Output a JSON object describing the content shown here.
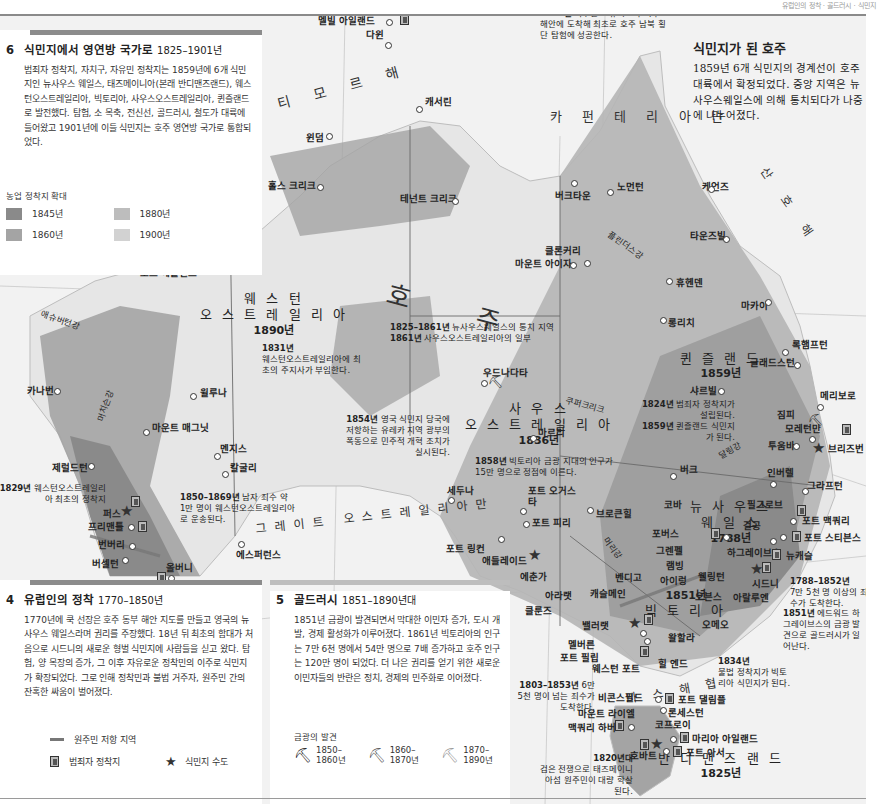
{
  "page_header": "유럽인의 정착 · 골드러시 · 식민지",
  "colors": {
    "ocean": "#f2f2f2",
    "settled_1845": "#8a8a8a",
    "settled_1860": "#a4a4a4",
    "settled_1880": "#bdbdbd",
    "settled_1900": "#d2d2d2",
    "unsettled": "#e9e9e9",
    "panel_bar": "#8c8c8c",
    "resistance": "#777777"
  },
  "panel6": {
    "number": "6",
    "title": "식민지에서 영연방 국가로",
    "years": "1825–1901년",
    "body": "범죄자 정착지, 자치구, 자유민 정착지는 1859년에 6개 식민지인 뉴사우스 웨일스, 태즈메이니아(본래 반디맨즈랜드), 웨스턴오스트레일리아, 빅토리아, 사우스오스트레일리아, 퀸즐랜드로 발전했다. 탐험, 소 목축, 전신선, 골드러시, 철도가 대륙에 들어왔고 1901년에 이들 식민지는 호주 영연방 국가로 통합되었다.",
    "legend_title": "농업 정착지 확대",
    "legend": [
      {
        "label": "1845년",
        "color": "#8a8a8a"
      },
      {
        "label": "1880년",
        "color": "#bdbdbd"
      },
      {
        "label": "1860년",
        "color": "#a4a4a4"
      },
      {
        "label": "1900년",
        "color": "#d2d2d2"
      }
    ]
  },
  "intro": {
    "title": "식민지가 된 호주",
    "body": "1859년 6개 식민지의 경계선이 호주 대륙에서 확정되었다. 중앙 지역은 뉴사우스웨일스에 의해 통치되다가 나중에 나누어졌다."
  },
  "panel4": {
    "number": "4",
    "title": "유럽인의 정착",
    "years": "1770–1850년",
    "body": "1770년에 쿡 선장은 호주 동부 해안 지도를 만들고 영국의 뉴사우스 웨일스라며 권리를 주장했다. 18년 뒤 최초의 함대가 처음으로 시드니의 새로운 형벌 식민지에 사람들을 싣고 왔다. 탐험, 양 목장의 증가, 그 이후 자유로운 정착민의 이주로 식민지가 확장되었다. 그로 인해 정착민과 불법 거주자, 원주민 간의 잔혹한 싸움이 벌어졌다.",
    "legend": {
      "resistance": "원주민 저항 지역",
      "convict": "범죄자 정착지",
      "capital": "식민지 수도"
    }
  },
  "panel5": {
    "number": "5",
    "title": "골드러시",
    "years": "1851–1890년대",
    "body": "1851년 금광이 발견되면서 막대한 이민자 증가, 도시 개발, 경제 활성화가 이루어졌다. 1861년 빅토리아의 인구는 7만 6천 명에서 54만 명으로 7배 증가하고 호주 인구는 120만 명이 되었다. 더 나은 권리를 얻기 위한 새로운 이민자들의 반란은 정치, 경제의 민주화로 이어졌다.",
    "legend_title": "금광의 발견",
    "legend": [
      {
        "l1": "1850–",
        "l2": "1860년",
        "color": "#222"
      },
      {
        "l1": "1860–",
        "l2": "1870년",
        "color": "#555"
      },
      {
        "l1": "1870–",
        "l2": "1890년",
        "color": "#999"
      }
    ]
  },
  "seas": {
    "timor": "티 모 르 해",
    "carpentaria": "카 펀 테 리 아 만",
    "coral": "산 호 해",
    "bight": "그레이트 오스트레일리아만",
    "bass": "바 스 해 협",
    "continent": "호  주"
  },
  "regions": {
    "wa": {
      "name1": "웨 스 턴",
      "name2": "오 스 트 레 일 리 아",
      "year": "1890년"
    },
    "sa": {
      "name1": "사 우 스",
      "name2": "오 스 트 레 일 리 아",
      "year": "1836년"
    },
    "qld": {
      "name1": "퀸 즐 랜 드",
      "year": "1859년"
    },
    "nsw": {
      "name1": "뉴 사 우 스",
      "name2": "웨 일 스",
      "year": "1788년"
    },
    "vic": {
      "year": "1851년",
      "name1": "빅 토 리 아"
    },
    "tas": {
      "name1": "반 디 맨 즈 랜 드",
      "year": "1825년"
    }
  },
  "rivers": {
    "ashburton": "애슈버턴강",
    "murchison": "머치슨강",
    "flinders": "플린더스강",
    "cooper": "쿠퍼크리크",
    "darling": "달링강",
    "murray": "머리강"
  },
  "places": {
    "melville": "멜빌 아일랜드",
    "darwin": "다윈",
    "katherine": "캐서린",
    "wyndham": "윈덤",
    "halls_creek": "홀스 크리크",
    "tennant_creek": "테넌트 크리크",
    "burketown": "버크타운",
    "normanton": "노먼턴",
    "cairns": "케언즈",
    "townsville": "타운즈빌",
    "cloncurry": "클론커리",
    "mount_isa": "마운트 아이자",
    "hughenden": "휴헨덴",
    "mackay": "마카이",
    "longreach": "롱리치",
    "rockhampton": "록햄프턴",
    "gladstone": "글래드스턴",
    "charleville": "샤르빌",
    "maryborough": "메리보로",
    "gympie": "짐피",
    "moreton_bay": "모레턴만",
    "toowoomba": "투움바",
    "brisbane": "브리즈번",
    "port_hedland": "포트 헤들랜드",
    "carnarvon": "카나번",
    "wiluna": "윌루나",
    "mount_magnet": "마운트 매그닛",
    "menzies": "멘지스",
    "kalgoorlie": "칼굴리",
    "geraldton": "제럴드턴",
    "perth": "퍼스",
    "fremantle": "프리맨틀",
    "bunbury": "번버리",
    "busselton": "버셀턴",
    "albany": "올버니",
    "esperance": "에스퍼런스",
    "oodnadatta": "우드나다타",
    "marree": "마르리",
    "ceduna": "세두나",
    "port_augusta": "포트 오거스타",
    "port_pirie": "포트 피리",
    "broken_hill": "브로큰힐",
    "bourke": "버크",
    "cobar": "코바",
    "port_lincoln": "포트 링컨",
    "adelaide": "애들레이드",
    "echunga": "에춘가",
    "ararat": "아라랫",
    "clunes": "클룬즈",
    "ballarat": "밸러랫",
    "castlemaine": "캐슬메인",
    "bendigo": "벤디고",
    "melbourne": "멜버른",
    "port_phillip": "포트 필립",
    "westernport": "웨스턴 포트",
    "walhalla": "왈할라",
    "hill_end": "힐 엔드",
    "omeo": "오메오",
    "ovens": "오븐스",
    "araluen": "아랄루엔",
    "beechworth": "아이렁",
    "wellington": "웰링턴",
    "lambing": "램빙",
    "grenfell": "그렌펠",
    "forbes": "포버스",
    "hargraves": "하그레이브스",
    "sydney": "시드니",
    "newcastle": "뉴캐슬",
    "port_stephens": "포트 스티븐스",
    "port_macquarie": "포트 맥쿼리",
    "gulgong": "걸공",
    "peel_grove": "필그로브",
    "inverell": "인버렐",
    "grafton": "그라프턴",
    "beaconsfield": "비콘스필드",
    "port_dalrymple": "포트 댈림플",
    "launceston": "론세스턴",
    "mount_lyell": "마운트 라이엘",
    "macquarie_harbour": "맥쿼리 하버",
    "zeehan": "코프로이",
    "maria_island": "마리아 아일랜드",
    "hobart": "호바트",
    "port_arthur": "포트 아서"
  },
  "notes": {
    "n1862": {
      "year": "1862년",
      "text": "맥두얼 스튜어트가 북부 해안에 도착해 최초로 호주 남북 횡단 탐험에 성공한다."
    },
    "n1831": {
      "year": "1831년",
      "text": "웨스턴오스트레일리아에 최초의 주지사가 부임한다."
    },
    "n1825": {
      "l1y": "1825–1861년",
      "l1": "뉴사우스웨일스의 통치 지역",
      "l2y": "1861년",
      "l2": "사우스오스트레일리아의 일부"
    },
    "n1854": {
      "year": "1854년",
      "text": "영국 식민지 당국에 저항하는 유레카 지역 광부의 폭동으로 민주적 개혁 조치가 실시된다."
    },
    "n1858": {
      "year": "1858년",
      "text": "빅토리아 금광 지대의 인구가 15만 명으로 정점에 이른다."
    },
    "n1824": {
      "year": "1824년",
      "text": "범죄자 정착지가 설립된다.",
      "year2": "1859년",
      "text2": "퀸즐랜드 식민지가 된다."
    },
    "n1829": {
      "year": "1829년",
      "text": "웨스턴오스트레일리아 최초의 정착지"
    },
    "n1850": {
      "year": "1850–1869년",
      "text": "남자 죄수 약 1만 명이 웨스턴오스트레일리아로 운송된다."
    },
    "n1788": {
      "year": "1788–1852년",
      "text": "7만 5천 명 이상의 죄수가 도착한다."
    },
    "n1851": {
      "year": "1851년",
      "text": "에드워드 하그레이브스의 금광 발견으로 골드러시가 일어난다."
    },
    "n1834": {
      "year": "1834년",
      "text": "불법 정착지가 빅토리아 식민지가 된다."
    },
    "n1803": {
      "year": "1803–1853년",
      "text": "6만 5천 명이 넘는 죄수가 도착한다."
    },
    "n1820": {
      "year": "1820년대",
      "text": "검은 전쟁으로 태즈메이니아섬 원주민이 대량 학살된다."
    }
  }
}
